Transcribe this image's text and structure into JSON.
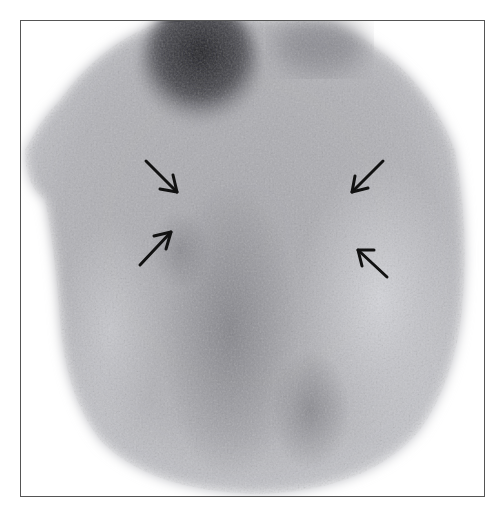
{
  "figure": {
    "type": "nuclear medicine scintigraphy scan (grayscale)",
    "frame": {
      "x": 20,
      "y": 20,
      "width": 465,
      "height": 477,
      "border_color": "#555555"
    },
    "colors": {
      "background": "#ffffff",
      "body_mid": "#a9a9ae",
      "body_light": "#c9cace",
      "body_dark": "#6f6f74",
      "hot_spot": "#2a2a2e",
      "arrow": "#111111"
    },
    "arrows": [
      {
        "id": "arrow-upper-left",
        "tail": [
          146,
          161
        ],
        "head": [
          177,
          192
        ]
      },
      {
        "id": "arrow-lower-left",
        "tail": [
          140,
          265
        ],
        "head": [
          171,
          232
        ]
      },
      {
        "id": "arrow-upper-right",
        "tail": [
          383,
          161
        ],
        "head": [
          352,
          192
        ]
      },
      {
        "id": "arrow-lower-right",
        "tail": [
          387,
          277
        ],
        "head": [
          358,
          250
        ]
      }
    ],
    "caption": "Scan image with four arrows indicating bilateral regions of interest"
  }
}
